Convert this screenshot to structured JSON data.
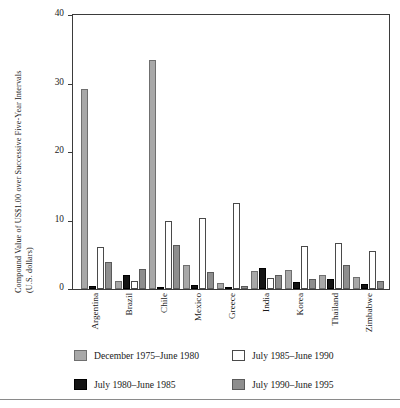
{
  "chart_data": {
    "type": "bar",
    "title": "",
    "xlabel": "",
    "ylabel_line1": "Compound Value of US$1.00 over Successive Five-Year Intervals",
    "ylabel_line2": "(U.S. dollars)",
    "ylim": [
      0,
      40
    ],
    "yticks": [
      0,
      10,
      20,
      30,
      40
    ],
    "grid": false,
    "legend_position": "bottom",
    "categories": [
      "Argentina",
      "Brazil",
      "Chile",
      "Mexico",
      "Greece",
      "India",
      "Korea",
      "Thailand",
      "Zimbabwe"
    ],
    "series": [
      {
        "name": "December 1975–June 1980",
        "color": "#a8a8a8",
        "values": [
          29.2,
          1.1,
          33.4,
          3.5,
          0.9,
          2.7,
          2.8,
          2.0,
          1.8
        ]
      },
      {
        "name": "July 1980–June 1985",
        "color": "#141414",
        "values": [
          0.4,
          2.1,
          0.3,
          0.6,
          0.3,
          3.0,
          1.0,
          1.5,
          0.8
        ]
      },
      {
        "name": "July 1985–June 1990",
        "color": "#ffffff",
        "values": [
          6.2,
          1.2,
          9.9,
          10.3,
          12.6,
          1.6,
          6.3,
          6.7,
          5.6
        ]
      },
      {
        "name": "July 1990–June 1995",
        "color": "#8e8e8e",
        "values": [
          4.0,
          2.9,
          6.4,
          2.5,
          0.5,
          2.0,
          1.5,
          3.5,
          1.2
        ]
      }
    ]
  }
}
